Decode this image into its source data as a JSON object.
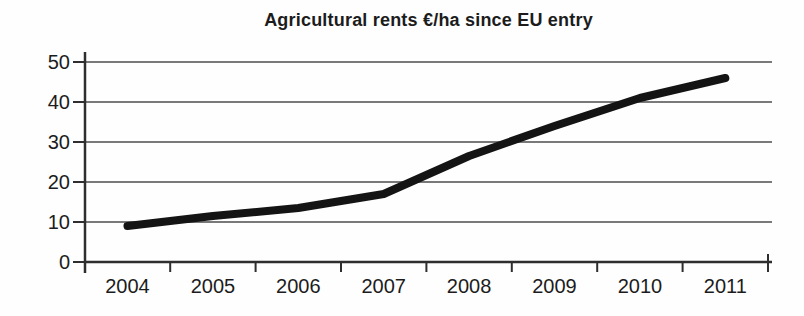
{
  "chart_data": {
    "type": "line",
    "title": "Agricultural rents €/ha since EU entry",
    "categories": [
      "2004",
      "2005",
      "2006",
      "2007",
      "2008",
      "2009",
      "2010",
      "2011"
    ],
    "series": [
      {
        "name": "Agricultural rents €/ha",
        "values": [
          9,
          11.5,
          13.5,
          17,
          26.5,
          34,
          41,
          46
        ]
      }
    ],
    "xlabel": "",
    "ylabel": "",
    "ylim": [
      0,
      50
    ],
    "yticks": [
      0,
      10,
      20,
      30,
      40,
      50
    ],
    "grid": "horizontal",
    "legend": "none",
    "colors": {
      "line": "#141414",
      "grid": "#4d4d4d",
      "axis": "#2e2e2e",
      "text": "#1c1c1c"
    }
  }
}
